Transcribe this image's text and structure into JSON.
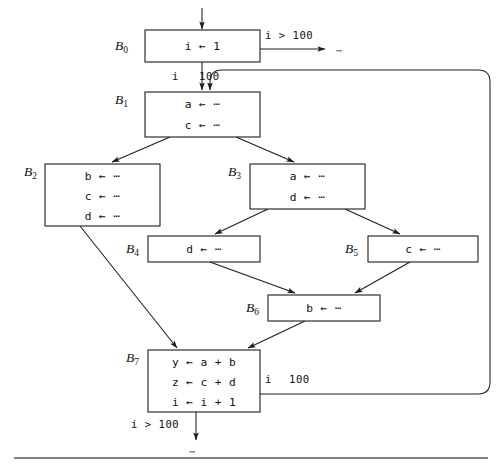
{
  "figure": {
    "type": "control-flow-graph",
    "entry_arrow": "down-into-B0",
    "bottom_rule": true
  },
  "blocks": [
    {
      "id": "B0",
      "label": "B",
      "subscript": "0",
      "statements": [
        "i ← 1"
      ],
      "x": 145,
      "y": 30,
      "w": 115,
      "h": 32,
      "label_x": 115,
      "label_y": 46
    },
    {
      "id": "B1",
      "label": "B",
      "subscript": "1",
      "statements": [
        "a ← ⋯",
        "c ← ⋯"
      ],
      "x": 145,
      "y": 92,
      "w": 115,
      "h": 45,
      "label_x": 115,
      "label_y": 100
    },
    {
      "id": "B2",
      "label": "B",
      "subscript": "2",
      "statements": [
        "b ← ⋯",
        "c ← ⋯",
        "d ← ⋯"
      ],
      "x": 45,
      "y": 164,
      "w": 115,
      "h": 62,
      "label_x": 24,
      "label_y": 172
    },
    {
      "id": "B3",
      "label": "B",
      "subscript": "3",
      "statements": [
        "a ← ⋯",
        "d ← ⋯"
      ],
      "x": 250,
      "y": 164,
      "w": 115,
      "h": 45,
      "label_x": 228,
      "label_y": 172
    },
    {
      "id": "B4",
      "label": "B",
      "subscript": "4",
      "statements": [
        "d ← ⋯"
      ],
      "x": 148,
      "y": 236,
      "w": 112,
      "h": 26,
      "label_x": 126,
      "label_y": 249
    },
    {
      "id": "B5",
      "label": "B",
      "subscript": "5",
      "statements": [
        "c ← ⋯"
      ],
      "x": 368,
      "y": 236,
      "w": 110,
      "h": 26,
      "label_x": 345,
      "label_y": 249
    },
    {
      "id": "B6",
      "label": "B",
      "subscript": "6",
      "statements": [
        "b ← ⋯"
      ],
      "x": 268,
      "y": 295,
      "w": 112,
      "h": 26,
      "label_x": 246,
      "label_y": 308
    },
    {
      "id": "B7",
      "label": "B",
      "subscript": "7",
      "statements": [
        "y ← a + b",
        "z ← c + d",
        "i ← i + 1"
      ],
      "x": 148,
      "y": 350,
      "w": 112,
      "h": 62,
      "label_x": 126,
      "label_y": 358
    }
  ],
  "edge_labels": [
    {
      "text": "i > 100",
      "x": 265,
      "y": 39,
      "name": "edge-label-b0-exit-gt"
    },
    {
      "text": "i",
      "x": 172,
      "y": 80,
      "name": "edge-label-b0-loop-i"
    },
    {
      "text": "100",
      "x": 199,
      "y": 80,
      "name": "edge-label-b0-loop-100"
    },
    {
      "text": "i",
      "x": 265,
      "y": 383,
      "name": "edge-label-b7-back-i"
    },
    {
      "text": "100",
      "x": 289,
      "y": 383,
      "name": "edge-label-b7-back-100"
    },
    {
      "text": "i > 100",
      "x": 131,
      "y": 428,
      "name": "edge-label-b7-exit-gt"
    }
  ],
  "ellipses": [
    {
      "text": "⋯",
      "x": 336,
      "y": 54,
      "name": "ellipsis-b0-exit"
    },
    {
      "text": "⋯",
      "x": 196,
      "y": 452,
      "name": "ellipsis-b7-exit"
    }
  ]
}
